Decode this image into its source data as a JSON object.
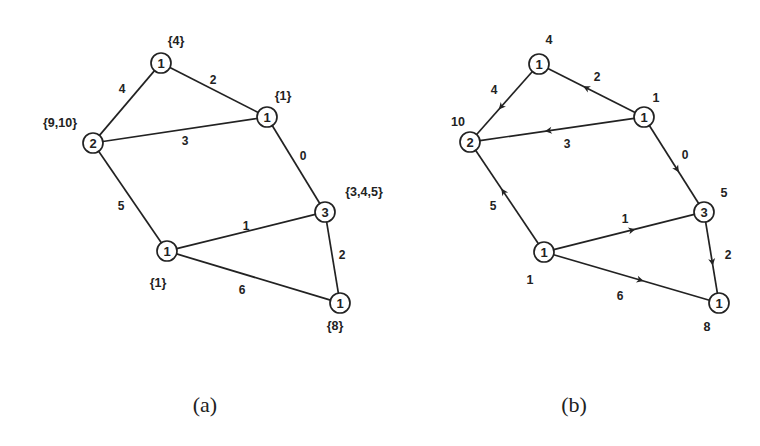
{
  "figure": {
    "panels": [
      {
        "id": "a",
        "caption": "(a)",
        "caption_pos": [
          205,
          404
        ],
        "directed": false,
        "nodes": [
          {
            "id": "top",
            "x": 161,
            "y": 63,
            "value": "1",
            "annotation": "{4}",
            "annot_pos": [
              176,
              41
            ]
          },
          {
            "id": "right",
            "x": 267,
            "y": 117,
            "value": "1",
            "annotation": "{1}",
            "annot_pos": [
              283,
              96
            ]
          },
          {
            "id": "left",
            "x": 93,
            "y": 143,
            "value": "2",
            "annotation": "{9,10}",
            "annot_pos": [
              60,
              123
            ]
          },
          {
            "id": "mid",
            "x": 325,
            "y": 212,
            "value": "3",
            "annotation": "{3,4,5}",
            "annot_pos": [
              364,
              192
            ]
          },
          {
            "id": "bottom",
            "x": 167,
            "y": 251,
            "value": "1",
            "annotation": "{1}",
            "annot_pos": [
              158,
              283
            ]
          },
          {
            "id": "far",
            "x": 340,
            "y": 303,
            "value": "1",
            "annotation": "{8}",
            "annot_pos": [
              335,
              326
            ]
          }
        ],
        "edges": [
          {
            "from": "left",
            "to": "top",
            "weight": "4",
            "label_pos": [
              122,
              89
            ]
          },
          {
            "from": "top",
            "to": "right",
            "weight": "2",
            "label_pos": [
              213,
              80
            ]
          },
          {
            "from": "left",
            "to": "right",
            "weight": "3",
            "label_pos": [
              185,
              141
            ]
          },
          {
            "from": "right",
            "to": "mid",
            "weight": "0",
            "label_pos": [
              303,
              156
            ]
          },
          {
            "from": "left",
            "to": "bottom",
            "weight": "5",
            "label_pos": [
              121,
              206
            ]
          },
          {
            "from": "bottom",
            "to": "mid",
            "weight": "1",
            "label_pos": [
              246,
              226
            ]
          },
          {
            "from": "mid",
            "to": "far",
            "weight": "2",
            "label_pos": [
              342,
              255
            ]
          },
          {
            "from": "bottom",
            "to": "far",
            "weight": "6",
            "label_pos": [
              242,
              290
            ]
          }
        ]
      },
      {
        "id": "b",
        "caption": "(b)",
        "caption_pos": [
          574,
          404
        ],
        "directed": true,
        "nodes": [
          {
            "id": "top",
            "x": 539,
            "y": 64,
            "value": "1",
            "annotation": "4",
            "annot_pos": [
              549,
              40
            ]
          },
          {
            "id": "right",
            "x": 644,
            "y": 117,
            "value": "1",
            "annotation": "1",
            "annot_pos": [
              656,
              98
            ]
          },
          {
            "id": "left",
            "x": 470,
            "y": 142,
            "value": "2",
            "annotation": "10",
            "annot_pos": [
              458,
              122
            ]
          },
          {
            "id": "mid",
            "x": 704,
            "y": 212,
            "value": "3",
            "annotation": "5",
            "annot_pos": [
              724,
              193
            ]
          },
          {
            "id": "bottom",
            "x": 544,
            "y": 252,
            "value": "1",
            "annotation": "1",
            "annot_pos": [
              530,
              280
            ]
          },
          {
            "id": "far",
            "x": 719,
            "y": 303,
            "value": "1",
            "annotation": "8",
            "annot_pos": [
              707,
              327
            ]
          }
        ],
        "edges": [
          {
            "from": "top",
            "to": "left",
            "weight": "4",
            "label_pos": [
              494,
              90
            ]
          },
          {
            "from": "right",
            "to": "top",
            "weight": "2",
            "label_pos": [
              597,
              77
            ]
          },
          {
            "from": "right",
            "to": "left",
            "weight": "3",
            "label_pos": [
              567,
              144
            ]
          },
          {
            "from": "right",
            "to": "mid",
            "weight": "0",
            "label_pos": [
              685,
              155
            ]
          },
          {
            "from": "bottom",
            "to": "left",
            "weight": "5",
            "label_pos": [
              493,
              206
            ]
          },
          {
            "from": "bottom",
            "to": "mid",
            "weight": "1",
            "label_pos": [
              625,
              219
            ]
          },
          {
            "from": "mid",
            "to": "far",
            "weight": "2",
            "label_pos": [
              728,
              255
            ]
          },
          {
            "from": "bottom",
            "to": "far",
            "weight": "6",
            "label_pos": [
              620,
              296
            ]
          }
        ]
      }
    ]
  }
}
